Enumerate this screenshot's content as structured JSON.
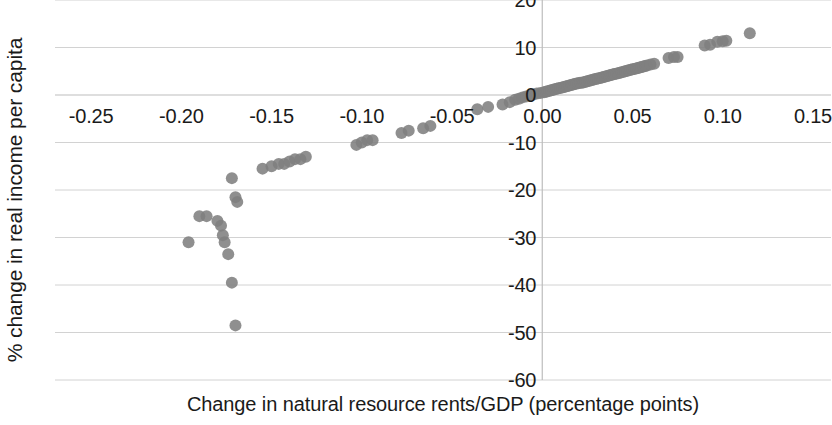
{
  "chart_data": {
    "type": "scatter",
    "title": "",
    "xlabel": "Change in natural resource rents/GDP (percentage points)",
    "ylabel": "% change in real income per capita",
    "xlim": [
      -0.27,
      0.16
    ],
    "ylim": [
      -60,
      20
    ],
    "xticks": [
      -0.25,
      -0.2,
      -0.15,
      -0.1,
      -0.05,
      0.0,
      0.05,
      0.1,
      0.15
    ],
    "xticklabels": [
      "-0.25",
      "-0.20",
      "-0.15",
      "-0.10",
      "-0.05",
      "0.00",
      "0.05",
      "0.10",
      "0.15"
    ],
    "yticks": [
      20,
      10,
      0,
      -10,
      -20,
      -30,
      -40,
      -50,
      -60
    ],
    "yticklabels": [
      "20",
      "10",
      "0",
      "-10",
      "-20",
      "-30",
      "-40",
      "-50",
      "-60"
    ],
    "grid": true,
    "grid_axis": "y",
    "legend": false,
    "marker_color": "#808080",
    "marker_size": 9,
    "series": [
      {
        "name": "Countries",
        "points": [
          [
            -0.17,
            -48.5
          ],
          [
            -0.172,
            -39.5
          ],
          [
            -0.174,
            -33.5
          ],
          [
            -0.176,
            -31.0
          ],
          [
            -0.177,
            -29.5
          ],
          [
            -0.196,
            -31.0
          ],
          [
            -0.19,
            -25.5
          ],
          [
            -0.186,
            -25.5
          ],
          [
            -0.18,
            -26.5
          ],
          [
            -0.178,
            -27.5
          ],
          [
            -0.169,
            -22.5
          ],
          [
            -0.17,
            -21.5
          ],
          [
            -0.172,
            -17.5
          ],
          [
            -0.155,
            -15.5
          ],
          [
            -0.15,
            -15.0
          ],
          [
            -0.146,
            -14.5
          ],
          [
            -0.143,
            -14.5
          ],
          [
            -0.14,
            -14.0
          ],
          [
            -0.137,
            -13.5
          ],
          [
            -0.134,
            -13.5
          ],
          [
            -0.131,
            -13.0
          ],
          [
            -0.103,
            -10.5
          ],
          [
            -0.1,
            -10.0
          ],
          [
            -0.097,
            -9.5
          ],
          [
            -0.094,
            -9.5
          ],
          [
            -0.078,
            -8.0
          ],
          [
            -0.074,
            -7.5
          ],
          [
            -0.066,
            -7.0
          ],
          [
            -0.062,
            -6.5
          ],
          [
            -0.036,
            -3.0
          ],
          [
            -0.03,
            -2.5
          ],
          [
            -0.022,
            -2.0
          ],
          [
            -0.018,
            -1.5
          ],
          [
            -0.015,
            -1.0
          ],
          [
            -0.013,
            -0.8
          ],
          [
            -0.011,
            -0.5
          ],
          [
            -0.009,
            -0.3
          ],
          [
            -0.007,
            -0.1
          ],
          [
            -0.005,
            0.1
          ],
          [
            -0.003,
            0.3
          ],
          [
            -0.001,
            0.4
          ],
          [
            0.001,
            0.6
          ],
          [
            0.002,
            0.7
          ],
          [
            0.003,
            0.8
          ],
          [
            0.004,
            0.9
          ],
          [
            0.005,
            1.0
          ],
          [
            0.006,
            1.1
          ],
          [
            0.007,
            1.2
          ],
          [
            0.008,
            1.3
          ],
          [
            0.009,
            1.4
          ],
          [
            0.01,
            1.5
          ],
          [
            0.011,
            1.6
          ],
          [
            0.012,
            1.7
          ],
          [
            0.013,
            1.8
          ],
          [
            0.014,
            1.9
          ],
          [
            0.015,
            2.0
          ],
          [
            0.016,
            2.1
          ],
          [
            0.017,
            2.2
          ],
          [
            0.018,
            2.3
          ],
          [
            0.019,
            2.4
          ],
          [
            0.02,
            2.5
          ],
          [
            0.021,
            2.6
          ],
          [
            0.022,
            2.6
          ],
          [
            0.023,
            2.7
          ],
          [
            0.024,
            2.8
          ],
          [
            0.025,
            2.9
          ],
          [
            0.026,
            3.0
          ],
          [
            0.027,
            3.1
          ],
          [
            0.028,
            3.2
          ],
          [
            0.029,
            3.3
          ],
          [
            0.03,
            3.4
          ],
          [
            0.031,
            3.5
          ],
          [
            0.032,
            3.6
          ],
          [
            0.033,
            3.7
          ],
          [
            0.034,
            3.8
          ],
          [
            0.035,
            3.9
          ],
          [
            0.036,
            4.0
          ],
          [
            0.037,
            4.1
          ],
          [
            0.038,
            4.2
          ],
          [
            0.039,
            4.3
          ],
          [
            0.04,
            4.4
          ],
          [
            0.041,
            4.5
          ],
          [
            0.042,
            4.6
          ],
          [
            0.043,
            4.7
          ],
          [
            0.044,
            4.8
          ],
          [
            0.045,
            4.9
          ],
          [
            0.046,
            5.0
          ],
          [
            0.047,
            5.1
          ],
          [
            0.048,
            5.2
          ],
          [
            0.049,
            5.3
          ],
          [
            0.05,
            5.4
          ],
          [
            0.051,
            5.5
          ],
          [
            0.052,
            5.6
          ],
          [
            0.053,
            5.7
          ],
          [
            0.054,
            5.8
          ],
          [
            0.055,
            5.9
          ],
          [
            0.056,
            6.0
          ],
          [
            0.057,
            6.1
          ],
          [
            0.058,
            6.2
          ],
          [
            0.06,
            6.4
          ],
          [
            0.062,
            6.6
          ],
          [
            0.07,
            7.8
          ],
          [
            0.073,
            8.0
          ],
          [
            0.075,
            8.0
          ],
          [
            0.09,
            10.4
          ],
          [
            0.093,
            10.6
          ],
          [
            0.097,
            11.2
          ],
          [
            0.1,
            11.3
          ],
          [
            0.102,
            11.4
          ],
          [
            0.115,
            13.0
          ]
        ]
      }
    ]
  }
}
